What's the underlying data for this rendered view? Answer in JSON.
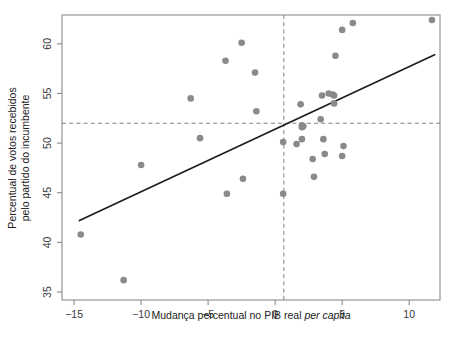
{
  "chart_data": {
    "type": "scatter",
    "title": "",
    "xlabel": "Mudança percentual no PIB real per capita",
    "xlabel_plain": "Mudança percentual no PIB real ",
    "xlabel_italic": "per capita",
    "ylabel_line1": "Percentual de votos recebidos",
    "ylabel_line2": "pelo partido do incumbente",
    "xlim": [
      -15.9,
      12.3
    ],
    "ylim": [
      34.2,
      62.9
    ],
    "xticks": [
      -15,
      -10,
      -5,
      0,
      5,
      10
    ],
    "xticklabels": [
      "−15",
      "−10",
      "−5",
      "0",
      "5",
      "10"
    ],
    "yticks": [
      35,
      40,
      45,
      50,
      55,
      60
    ],
    "yticklabels": [
      "35",
      "40",
      "45",
      "50",
      "55",
      "60"
    ],
    "grid": false,
    "legend": null,
    "point_color": "#8a8a8a",
    "line_color": "#1c1c1c",
    "reference_line_color": "#808080",
    "frame_color": "#8c8c8c",
    "reference_lines": {
      "vertical_x": 0.65,
      "horizontal_y": 52.0
    },
    "fit_line": {
      "x_start": -14.6,
      "y_start": 42.2,
      "x_end": 11.9,
      "y_end": 58.9,
      "slope": 0.63,
      "intercept": 51.4
    },
    "x": [
      -14.5,
      -11.3,
      -10.0,
      -6.3,
      -5.6,
      -3.7,
      -3.6,
      -2.5,
      -2.4,
      -1.5,
      -1.4,
      0.6,
      0.6,
      1.6,
      1.9,
      2.0,
      2.0,
      2.0,
      2.1,
      2.8,
      2.9,
      3.4,
      3.5,
      3.6,
      3.7,
      4.0,
      4.3,
      4.4,
      4.4,
      4.5,
      5.0,
      5.0,
      5.1,
      5.8,
      11.7
    ],
    "y": [
      40.8,
      36.2,
      47.8,
      54.5,
      50.5,
      58.3,
      44.9,
      60.1,
      46.4,
      57.1,
      53.2,
      50.1,
      44.9,
      49.9,
      53.9,
      51.8,
      51.6,
      50.4,
      51.7,
      48.4,
      46.6,
      52.4,
      54.8,
      50.4,
      48.9,
      55.0,
      54.9,
      54.8,
      54.0,
      58.8,
      61.4,
      48.7,
      49.7,
      62.1,
      62.4
    ],
    "n_points": 35
  }
}
